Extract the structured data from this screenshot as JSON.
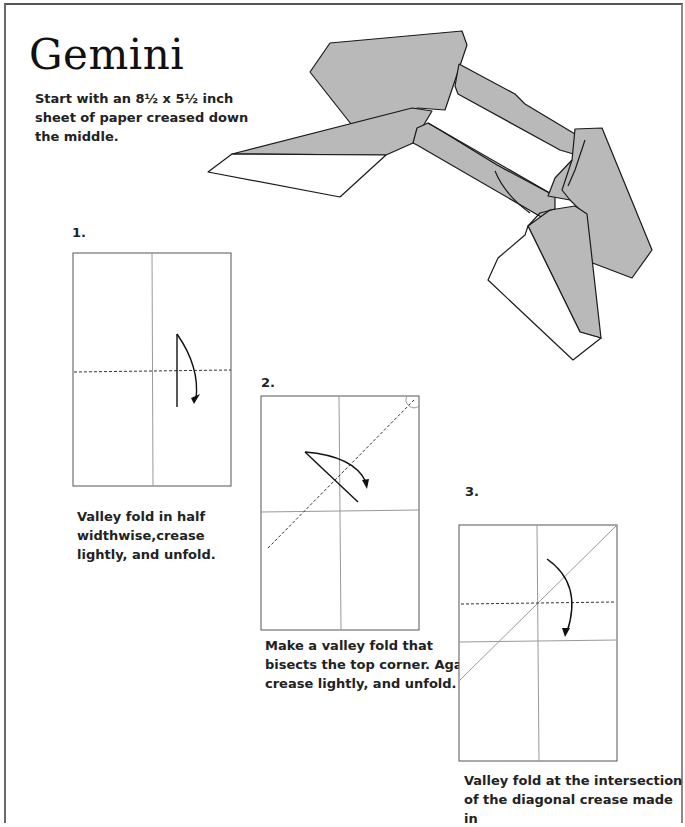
{
  "page": {
    "title": "Gemini",
    "intro": "Start with an 8½ x 5½ inch sheet of paper creased down the middle.",
    "colors": {
      "paper_fill": "#b9b9b9",
      "line": "#1a1a1a",
      "crease": "#9a9a9a",
      "text": "#222222"
    }
  },
  "model_image": {
    "label": "finished-gemini-model-illustration"
  },
  "steps": [
    {
      "number": "1.",
      "caption": "Valley fold in half widthwise,crease lightly, and unfold."
    },
    {
      "number": "2.",
      "caption": "Make a valley fold that bisects the top corner. Again, crease lightly, and unfold."
    },
    {
      "number": "3.",
      "caption": "Valley fold at the intersection of the diagonal crease made in"
    }
  ]
}
